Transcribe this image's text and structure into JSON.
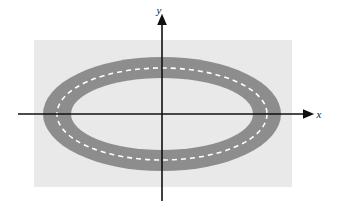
{
  "figure": {
    "background_color": "#ffffff",
    "width": 340,
    "height": 211
  },
  "ground": {
    "name": "ground-rectangle",
    "color": "#e9e9e9",
    "x": 34,
    "y": 40,
    "width": 258,
    "height": 147
  },
  "axes": {
    "color": "#101010",
    "stroke_width": 1.6,
    "origin": {
      "x": 162,
      "y": 114
    },
    "x_axis": {
      "label": "x",
      "start_x": 18,
      "end_x": 309,
      "y": 114,
      "arrow": "right"
    },
    "y_axis": {
      "label": "y",
      "x": 162,
      "start_y": 201,
      "end_y": 19,
      "arrow": "up"
    },
    "x_label_pos": {
      "x": 319,
      "y": 118
    },
    "y_label_pos": {
      "x": 159,
      "y": 14
    }
  },
  "track": {
    "name": "elliptical-road",
    "road_color": "#8d8d8d",
    "center": {
      "x": 162,
      "y": 114
    },
    "outer_ellipse": {
      "rx": 119,
      "ry": 57
    },
    "inner_ellipse": {
      "rx": 91,
      "ry": 36
    },
    "center_line": {
      "name": "dashed-center-line",
      "rx": 105,
      "ry": 46,
      "color": "#ffffff",
      "stroke_width": 1.6,
      "dash_pattern": "5 4"
    }
  },
  "chart_data": {
    "type": "diagram",
    "xlabel": "x",
    "ylabel": "y",
    "shapes": [
      {
        "name": "ground",
        "kind": "rectangle",
        "x": 34,
        "y": 40,
        "width": 258,
        "height": 147,
        "fill": "#e9e9e9"
      },
      {
        "name": "road-outer-boundary",
        "kind": "ellipse",
        "cx": 162,
        "cy": 114,
        "rx": 119,
        "ry": 57,
        "fill": "#8d8d8d"
      },
      {
        "name": "road-inner-boundary",
        "kind": "ellipse",
        "cx": 162,
        "cy": 114,
        "rx": 91,
        "ry": 36,
        "fill": "#e9e9e9"
      },
      {
        "name": "road-center-line",
        "kind": "ellipse",
        "cx": 162,
        "cy": 114,
        "rx": 105,
        "ry": 46,
        "fill": "none",
        "stroke": "#ffffff",
        "dash": "5 4"
      }
    ]
  }
}
